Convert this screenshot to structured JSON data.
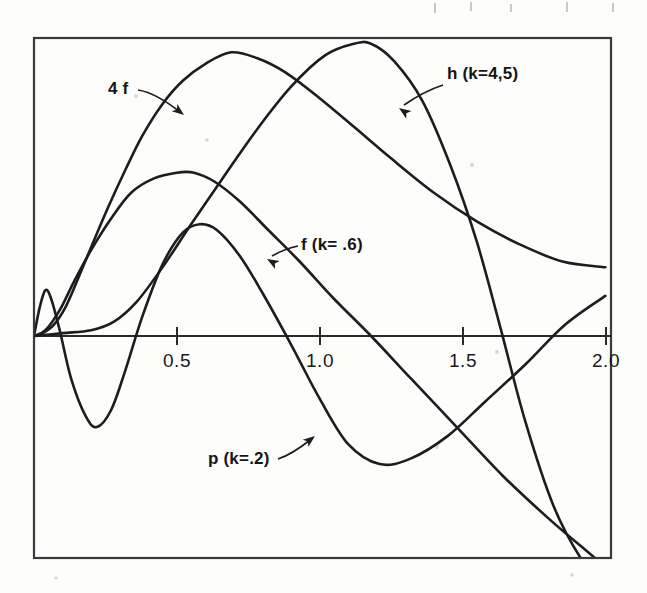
{
  "figure": {
    "background_color": "#fdfdfc",
    "ink_color": "#1d1d1d",
    "frame": {
      "x": 34,
      "y": 38,
      "width": 577,
      "height": 520
    }
  },
  "axis": {
    "name": "x-axis",
    "y_pixel": 336,
    "x_start": 34,
    "x_end": 611,
    "ticks": [
      {
        "label": "0.5",
        "value": 0.5,
        "x": 177
      },
      {
        "label": "1.0",
        "value": 1.0,
        "x": 320
      },
      {
        "label": "1.5",
        "value": 1.5,
        "x": 463
      },
      {
        "label": "2.0",
        "value": 2.0,
        "x": 606
      }
    ],
    "range": [
      0.0,
      2.02
    ]
  },
  "labels": [
    {
      "name": "label-4f",
      "text": "4 f",
      "x": 108,
      "y": 94,
      "leader": "M 138 90 C 152 92 166 101 180 112",
      "arrow": {
        "x": 184,
        "y": 115,
        "angle": 38
      }
    },
    {
      "name": "label-h",
      "text": "h (k=4,5)",
      "x": 447,
      "y": 79,
      "leader": "M 443 85 C 428 90 417 96 404 105",
      "arrow": {
        "x": 399,
        "y": 108,
        "angle": 215
      }
    },
    {
      "name": "label-f",
      "text": "f (k= .6)",
      "x": 301,
      "y": 250,
      "leader": "M 298 246 C 288 248 281 251 272 256",
      "arrow": {
        "x": 267,
        "y": 259,
        "angle": 210
      }
    },
    {
      "name": "label-p",
      "text": "p (k=.2)",
      "x": 208,
      "y": 464,
      "leader": "M 278 459 C 290 455 300 448 310 440",
      "arrow": {
        "x": 315,
        "y": 436,
        "angle": -38
      }
    }
  ],
  "chart_data": {
    "type": "line",
    "title": "",
    "xlabel": "",
    "ylabel": "",
    "xlim": [
      0.0,
      2.02
    ],
    "ylim": [
      -0.78,
      1.04
    ],
    "grid": false,
    "legend": "inline-annotations",
    "tick_labels_x": [
      "0.5",
      "1.0",
      "1.5",
      "2.0"
    ],
    "series": [
      {
        "name": "4 f",
        "label": "4 f",
        "annotation": "4 f",
        "comment": "four times f; large early hump peaking near x=0.69",
        "x": [
          0.0,
          0.03,
          0.07,
          0.11,
          0.15,
          0.2,
          0.26,
          0.32,
          0.38,
          0.45,
          0.52,
          0.6,
          0.69,
          0.78,
          0.88,
          1.0,
          1.12,
          1.25,
          1.4,
          1.55,
          1.7,
          1.85,
          2.0
        ],
        "y": [
          0.0,
          0.01,
          0.04,
          0.1,
          0.19,
          0.31,
          0.45,
          0.58,
          0.7,
          0.81,
          0.89,
          0.95,
          0.99,
          0.97,
          0.92,
          0.83,
          0.73,
          0.62,
          0.5,
          0.4,
          0.32,
          0.26,
          0.24
        ]
      },
      {
        "name": "h (k=4,5)",
        "label": "h (k=4,5)",
        "annotation": "h (k=4,5)",
        "comment": "flat near zero until x~0.3, peaks near x=1.17, crosses zero near x=1.63, plunges below",
        "x": [
          0.0,
          0.1,
          0.2,
          0.28,
          0.36,
          0.45,
          0.55,
          0.66,
          0.78,
          0.9,
          1.02,
          1.12,
          1.18,
          1.26,
          1.36,
          1.46,
          1.55,
          1.63,
          1.72,
          1.82,
          1.92,
          2.0
        ],
        "y": [
          0.0,
          0.01,
          0.02,
          0.05,
          0.12,
          0.24,
          0.39,
          0.55,
          0.72,
          0.87,
          0.98,
          1.02,
          1.02,
          0.96,
          0.82,
          0.59,
          0.33,
          0.04,
          -0.3,
          -0.6,
          -0.79,
          -0.88
        ]
      },
      {
        "name": "f (k= .6)",
        "label": "f (k= .6)",
        "annotation": "f (k= .6)",
        "comment": "medium hump peaking near x=0.56, decaying and dropping below axis past x=1.2",
        "x": [
          0.0,
          0.04,
          0.09,
          0.14,
          0.2,
          0.27,
          0.34,
          0.42,
          0.5,
          0.56,
          0.63,
          0.72,
          0.82,
          0.93,
          1.05,
          1.18,
          1.32,
          1.48,
          1.64,
          1.8,
          1.94,
          2.0
        ],
        "y": [
          0.0,
          0.02,
          0.09,
          0.19,
          0.3,
          0.41,
          0.5,
          0.55,
          0.57,
          0.57,
          0.54,
          0.47,
          0.37,
          0.26,
          0.13,
          0.0,
          -0.15,
          -0.32,
          -0.49,
          -0.64,
          -0.76,
          -0.81
        ]
      },
      {
        "name": "p (k=.2)",
        "label": "p (k=.2)",
        "annotation": "p (k=.2)",
        "comment": "sharp narrow spike near x=0.04, dips to deep minimum near x=0.22, rises to hump at x=0.60, falls to minimum near x=1.21, rises to right edge",
        "x": [
          0.0,
          0.02,
          0.04,
          0.06,
          0.09,
          0.13,
          0.18,
          0.22,
          0.27,
          0.32,
          0.38,
          0.45,
          0.52,
          0.58,
          0.64,
          0.72,
          0.8,
          0.9,
          1.0,
          1.1,
          1.21,
          1.32,
          1.45,
          1.58,
          1.72,
          1.86,
          2.0
        ],
        "y": [
          0.0,
          0.1,
          0.16,
          0.13,
          0.02,
          -0.15,
          -0.28,
          -0.32,
          -0.26,
          -0.12,
          0.07,
          0.25,
          0.36,
          0.39,
          0.37,
          0.28,
          0.15,
          -0.03,
          -0.22,
          -0.38,
          -0.45,
          -0.43,
          -0.35,
          -0.23,
          -0.1,
          0.04,
          0.14
        ]
      }
    ]
  }
}
